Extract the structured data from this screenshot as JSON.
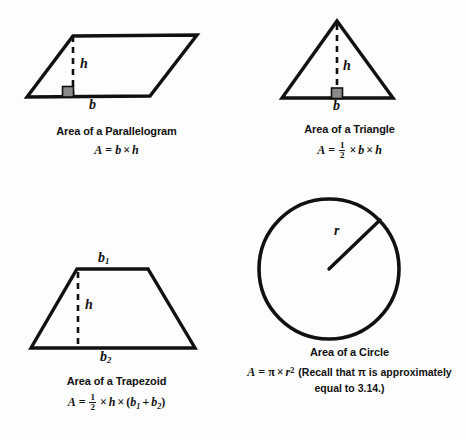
{
  "page": {
    "background": "#fdfdfd",
    "ink": "#111111",
    "marker_fill": "#8a8a8a"
  },
  "figures": [
    {
      "id": "parallelogram",
      "shape": "parallelogram",
      "caption_title": "Area of a Parallelogram",
      "formula_plain": "A = b × h",
      "labels": {
        "height": "h",
        "base": "b"
      },
      "right_angle_marker": true,
      "geometry": {
        "points": "73,11 197,10 150,71 27,72",
        "height_line": {
          "x1": 73,
          "y1": 11,
          "x2": 73,
          "y2": 71
        },
        "marker": {
          "x": 63,
          "y": 62,
          "w": 11,
          "h": 10
        }
      }
    },
    {
      "id": "triangle",
      "shape": "triangle",
      "caption_title": "Area of a Triangle",
      "formula_plain": "A = 1/2 × b × h",
      "labels": {
        "height": "h",
        "base": "b"
      },
      "right_angle_marker": true,
      "geometry": {
        "points": "104,11 160,88 49,88",
        "height_line": {
          "x1": 104,
          "y1": 13,
          "x2": 104,
          "y2": 88
        },
        "marker": {
          "x": 99,
          "y": 78,
          "w": 11,
          "h": 10
        }
      }
    },
    {
      "id": "trapezoid",
      "shape": "trapezoid",
      "caption_title": "Area of a Trapezoid",
      "formula_plain": "A = 1/2 × h × (b₁ + b₂)",
      "labels": {
        "height": "h",
        "top_base": "b₁",
        "bottom_base": "b₂",
        "top_base_main": "b",
        "top_base_sub": "1",
        "bottom_base_main": "b",
        "bottom_base_sub": "2"
      },
      "right_angle_marker": false,
      "geometry": {
        "points": "77,19 148,19 195,98 31,98",
        "height_line": {
          "x1": 78,
          "y1": 21,
          "x2": 78,
          "y2": 98
        }
      }
    },
    {
      "id": "circle",
      "shape": "circle",
      "caption_title": "Area of a Circle",
      "formula_plain": "A = π × r² (Recall that π is approximately equal to 3.14.)",
      "note_line_1": "(Recall that π is approximately",
      "note_line_2": "equal to 3.14.)",
      "labels": {
        "radius": "r"
      },
      "right_angle_marker": false,
      "geometry": {
        "center": {
          "cx": 96,
          "cy": 73
        },
        "radius": 70,
        "radius_line": {
          "x1": 96,
          "y1": 73,
          "x2": 147,
          "y2": 24
        }
      }
    }
  ],
  "symbols": {
    "times": "×",
    "pi": "π",
    "equals": "=",
    "plus": "+",
    "A": "A",
    "b": "b",
    "h": "h",
    "r": "r",
    "one": "1",
    "two": "2",
    "lparen": "(",
    "rparen": ")"
  }
}
